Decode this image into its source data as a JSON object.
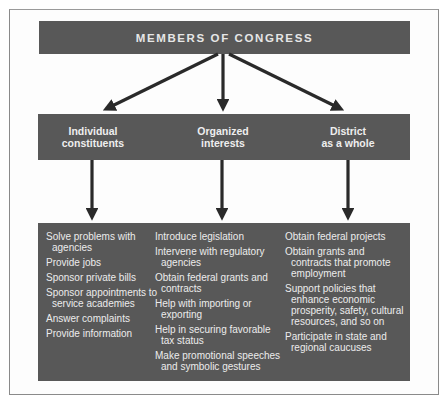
{
  "diagram": {
    "title": "MEMBERS OF CONGRESS",
    "categories": [
      {
        "label_line1": "Individual",
        "label_line2": "constituents",
        "items": [
          "Solve problems with agencies",
          "Provide jobs",
          "Sponsor private bills",
          "Sponsor appointments to service academies",
          "Answer complaints",
          "Provide information"
        ]
      },
      {
        "label_line1": "Organized",
        "label_line2": "interests",
        "items": [
          "Introduce legislation",
          "Intervene with regulatory agencies",
          "Obtain federal grants and contracts",
          "Help with importing or exporting",
          "Help in securing favorable tax status",
          "Make promotional speeches and symbolic gestures"
        ]
      },
      {
        "label_line1": "District",
        "label_line2": "as a whole",
        "items": [
          "Obtain federal projects",
          "Obtain grants and contracts that promote employment",
          "Support policies that enhance economic prosperity, safety, cultural resources, and so on",
          "Participate in state and regional caucuses"
        ]
      }
    ],
    "colors": {
      "box_fill": "#585858",
      "box_text": "#ececec",
      "arrow": "#2a2a2a",
      "frame": "#8a8a8a"
    }
  }
}
